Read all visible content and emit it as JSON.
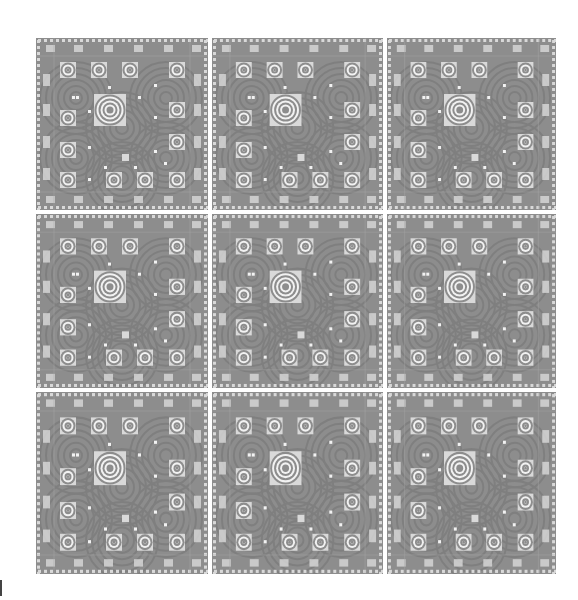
{
  "figure": {
    "rows": 3,
    "cols": 3,
    "tile_count": 9
  },
  "colors": {
    "background": "#ffffff",
    "die_base": "#8d8d8d",
    "ring_dark": "#7a7a7a",
    "pad_light": "#d9d9d9",
    "pad_white": "#f2f2f2",
    "edge_mark": "#444444"
  },
  "tiles": [
    {
      "row": 0,
      "col": 0,
      "x": 0,
      "y": 0,
      "w": 172,
      "h": 172
    },
    {
      "row": 0,
      "col": 1,
      "x": 176,
      "y": 0,
      "w": 171,
      "h": 172
    },
    {
      "row": 0,
      "col": 2,
      "x": 351,
      "y": 0,
      "w": 169,
      "h": 172
    },
    {
      "row": 1,
      "col": 0,
      "x": 0,
      "y": 176,
      "w": 172,
      "h": 174
    },
    {
      "row": 1,
      "col": 1,
      "x": 176,
      "y": 176,
      "w": 171,
      "h": 174
    },
    {
      "row": 1,
      "col": 2,
      "x": 351,
      "y": 176,
      "w": 169,
      "h": 174
    },
    {
      "row": 2,
      "col": 0,
      "x": 0,
      "y": 354,
      "w": 172,
      "h": 182
    },
    {
      "row": 2,
      "col": 1,
      "x": 176,
      "y": 354,
      "w": 171,
      "h": 182
    },
    {
      "row": 2,
      "col": 2,
      "x": 351,
      "y": 354,
      "w": 169,
      "h": 182
    }
  ],
  "die_features": {
    "large_ring_pad": {
      "x": 58,
      "y": 56,
      "size": 32,
      "rings": 4
    },
    "small_ring_pads": [
      {
        "x": 24,
        "y": 24
      },
      {
        "x": 55,
        "y": 24
      },
      {
        "x": 86,
        "y": 24
      },
      {
        "x": 133,
        "y": 24
      },
      {
        "x": 133,
        "y": 64
      },
      {
        "x": 24,
        "y": 72
      },
      {
        "x": 133,
        "y": 96
      },
      {
        "x": 24,
        "y": 104
      },
      {
        "x": 24,
        "y": 134
      },
      {
        "x": 70,
        "y": 134
      },
      {
        "x": 101,
        "y": 134
      },
      {
        "x": 133,
        "y": 134
      }
    ],
    "small_ring_pad_size": 16,
    "edge_pads_top": [
      10,
      38,
      68,
      98,
      128,
      156
    ],
    "edge_pads_side": [
      36,
      66,
      98,
      130
    ],
    "dots": [
      {
        "x": 40,
        "y": 58
      },
      {
        "x": 72,
        "y": 48
      },
      {
        "x": 102,
        "y": 58
      },
      {
        "x": 118,
        "y": 46
      },
      {
        "x": 52,
        "y": 72
      },
      {
        "x": 118,
        "y": 78
      },
      {
        "x": 52,
        "y": 108
      },
      {
        "x": 118,
        "y": 112
      },
      {
        "x": 68,
        "y": 128
      },
      {
        "x": 98,
        "y": 128
      },
      {
        "x": 128,
        "y": 124
      },
      {
        "x": 52,
        "y": 140
      },
      {
        "x": 36,
        "y": 58
      }
    ],
    "center_square": {
      "x": 86,
      "y": 116,
      "size": 7
    }
  }
}
